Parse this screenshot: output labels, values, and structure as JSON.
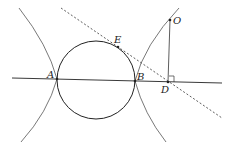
{
  "diagram": {
    "type": "geometry",
    "points": {
      "A": {
        "label": "A",
        "x": 57,
        "y": 79
      },
      "B": {
        "label": "B",
        "x": 135,
        "y": 81
      },
      "E": {
        "label": "E",
        "x": 118,
        "y": 47
      },
      "O": {
        "label": "O",
        "x": 170,
        "y": 20
      },
      "D": {
        "label": "D",
        "x": 168,
        "y": 82
      }
    },
    "circle": {
      "cx": 96,
      "cy": 80,
      "r": 39
    },
    "colors": {
      "stroke": "#222222",
      "curve": "#555555",
      "background": "#ffffff"
    }
  }
}
